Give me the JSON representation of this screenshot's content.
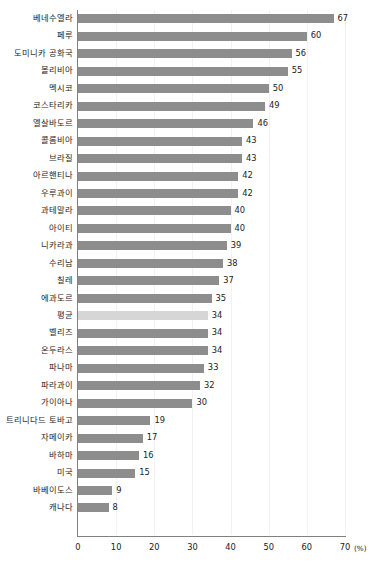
{
  "chart_data": {
    "type": "bar",
    "orientation": "horizontal",
    "title": "",
    "xlabel": "(%)",
    "ylabel": "",
    "xlim": [
      0,
      70
    ],
    "xticks": [
      0,
      10,
      20,
      30,
      40,
      50,
      60,
      70
    ],
    "grid": true,
    "grid_axis": "x",
    "legend": null,
    "bar_color": "#8d8d8d",
    "highlight_color": "#d6d6d6",
    "highlight_category": "평균",
    "categories": [
      "베네수엘라",
      "페루",
      "도미니카 공화국",
      "볼리비아",
      "멕시코",
      "코스타리카",
      "엘살바도르",
      "콜롬비아",
      "브라질",
      "아르핸티나",
      "우루과이",
      "과테말라",
      "아이티",
      "니카라과",
      "수리남",
      "칠레",
      "에과도르",
      "평균",
      "벨리즈",
      "온두라스",
      "파나마",
      "파라과이",
      "가이아나",
      "트리니다드 토바고",
      "자메이카",
      "바하마",
      "미국",
      "바베이도스",
      "캐나다"
    ],
    "values": [
      67,
      60,
      56,
      55,
      50,
      49,
      46,
      43,
      43,
      42,
      42,
      40,
      40,
      39,
      38,
      37,
      35,
      34,
      34,
      34,
      33,
      32,
      30,
      19,
      17,
      16,
      15,
      9,
      8
    ]
  }
}
